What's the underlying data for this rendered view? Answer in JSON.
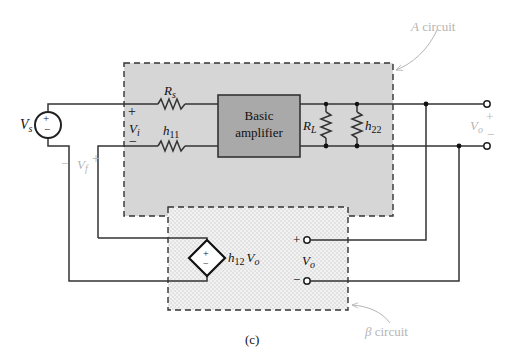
{
  "figure": {
    "caption": "(c)",
    "colors": {
      "a_circuit_fill": "#d6d6d6",
      "amplifier_fill": "#a9a9a9",
      "beta_fill": "#ededed",
      "wire": "#333333",
      "annotation": "#b5b5b5"
    }
  },
  "a_circuit": {
    "label_prefix": "A",
    "label_suffix": " circuit",
    "amplifier": {
      "line1": "Basic",
      "line2": "amplifier"
    },
    "rs": {
      "main": "R",
      "sub": "s"
    },
    "h11": {
      "main": "h",
      "sub": "11"
    },
    "rl": {
      "main": "R",
      "sub": "L"
    },
    "h22": {
      "main": "h",
      "sub": "22"
    },
    "vi": {
      "main": "V",
      "sub": "i",
      "plus": "+",
      "minus": "−"
    }
  },
  "source": {
    "main": "V",
    "sub": "s",
    "plus": "+",
    "minus": "−"
  },
  "feedback_voltage": {
    "minus": "−",
    "main": "V",
    "sub": "f",
    "plus": "+"
  },
  "output": {
    "main": "V",
    "sub": "o",
    "plus": "+",
    "minus": "−"
  },
  "beta_circuit": {
    "label_prefix": "β",
    "label_suffix": " circuit",
    "dep_source": {
      "h": "h",
      "sub": "12",
      "v": "V",
      "vsub": "o",
      "plus": "+",
      "minus": "−"
    },
    "vo": {
      "main": "V",
      "sub": "o",
      "plus": "+",
      "minus": "−"
    }
  }
}
